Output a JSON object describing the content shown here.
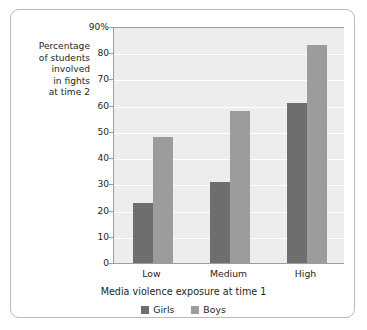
{
  "chart_data": {
    "type": "bar",
    "title": "",
    "categories": [
      "Low",
      "Medium",
      "High"
    ],
    "series": [
      {
        "name": "Girls",
        "color": "#6e6e6e",
        "values": [
          23,
          31,
          61
        ]
      },
      {
        "name": "Boys",
        "color": "#9c9c9c",
        "values": [
          48,
          58,
          83
        ]
      }
    ],
    "xlabel": "Media violence exposure at time 1",
    "ylabel": "Percentage of students involved in fights at time 2",
    "ylim": [
      0,
      90
    ],
    "ytick_values": [
      0,
      10,
      20,
      30,
      40,
      50,
      60,
      70,
      80,
      90
    ],
    "ytick_labels": [
      "0",
      "10",
      "20",
      "30",
      "40",
      "50",
      "60",
      "70",
      "80",
      "90%"
    ],
    "grid": true,
    "legend_position": "bottom"
  },
  "y_axis_title_lines": [
    "Percentage",
    "of students",
    "involved",
    "in fights",
    "at time 2"
  ],
  "colors": {
    "girls": "#6e6e6e",
    "boys": "#9c9c9c",
    "plot_background": "#ededed",
    "gridline": "#ffffff",
    "axis": "#9d9d9d",
    "frame_border": "#b9b9b9",
    "text": "#231f20"
  }
}
